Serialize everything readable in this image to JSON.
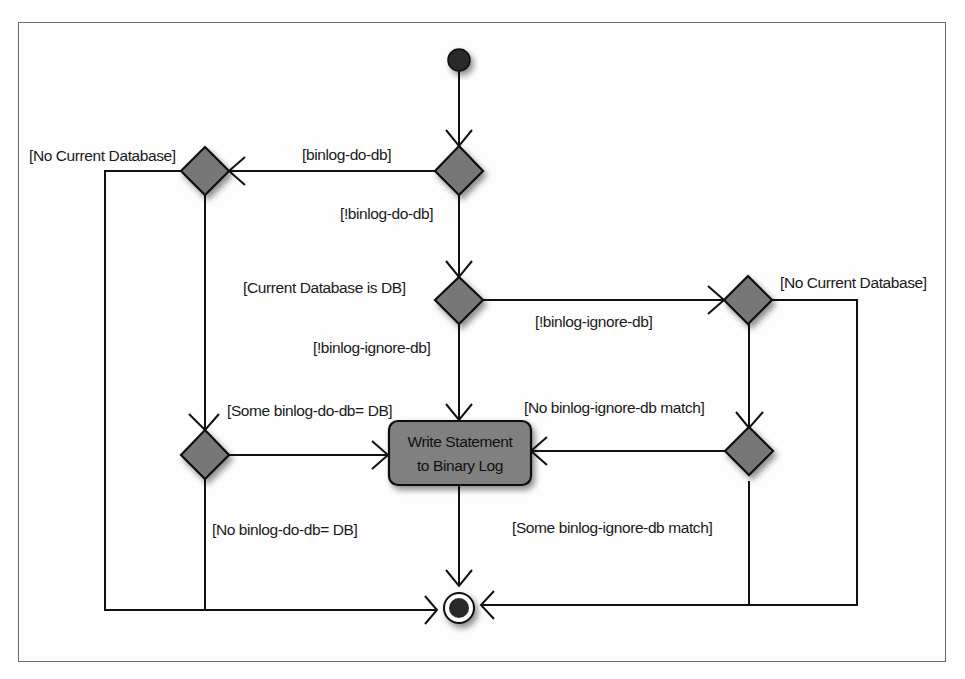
{
  "diagram": {
    "type": "uml-activity",
    "colors": {
      "frame": "#6a6a6a",
      "line": "#111111",
      "decision_fill": "#777777",
      "action_fill": "#808080",
      "node_dark": "#2a2a2a"
    },
    "nodes": {
      "start": {
        "label": "Initial node"
      },
      "d1": {
        "label": "binlog-do-db decision"
      },
      "d2": {
        "label": "Current database check (do-db)"
      },
      "d3": {
        "label": "Current database is DB decision"
      },
      "d4": {
        "label": "Some binlog-do-db = DB decision"
      },
      "d5": {
        "label": "No current database (ignore-db) decision"
      },
      "d6": {
        "label": "binlog-ignore-db match decision"
      },
      "action": {
        "line1": "Write Statement",
        "line2": "to Binary Log"
      },
      "end": {
        "label": "Final node"
      }
    },
    "labels": {
      "no_current_db_left": "[No Current Database]",
      "binlog_do_db": "[binlog-do-db]",
      "not_binlog_do_db": "[!binlog-do-db]",
      "current_db_is_db": "[Current Database is DB]",
      "not_binlog_ignore_db_right": "[!binlog-ignore-db]",
      "no_current_db_right": "[No Current Database]",
      "not_binlog_ignore_db_down": "[!binlog-ignore-db]",
      "some_binlog_do_db": "[Some binlog-do-db= DB]",
      "no_binlog_ignore_match": "[No binlog-ignore-db match]",
      "no_binlog_do_db": "[No binlog-do-db= DB]",
      "some_binlog_ignore_match": "[Some binlog-ignore-db match]"
    }
  }
}
